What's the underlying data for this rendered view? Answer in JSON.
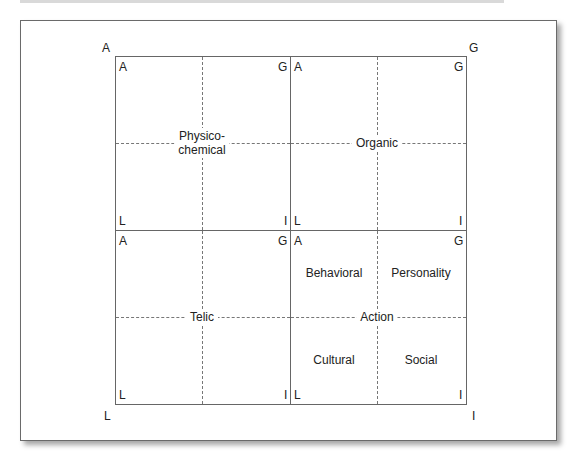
{
  "outer_corners": {
    "top_left": "A",
    "top_right": "G",
    "bottom_left": "L",
    "bottom_right": "I"
  },
  "quadrants": [
    {
      "id": "physicochemical",
      "title": "Physico-\nchemical",
      "title_line1": "Physico-",
      "title_line2": "chemical",
      "corners": {
        "tl": "A",
        "tr": "G",
        "bl": "L",
        "br": "I"
      },
      "sub_labels": []
    },
    {
      "id": "organic",
      "title": "Organic",
      "corners": {
        "tl": "A",
        "tr": "G",
        "bl": "L",
        "br": "I"
      },
      "sub_labels": []
    },
    {
      "id": "telic",
      "title": "Telic",
      "corners": {
        "tl": "A",
        "tr": "G",
        "bl": "L",
        "br": "I"
      },
      "sub_labels": []
    },
    {
      "id": "action",
      "title": "Action",
      "corners": {
        "tl": "A",
        "tr": "G",
        "bl": "L",
        "br": "I"
      },
      "sub_labels": [
        "Behavioral",
        "Personality",
        "Cultural",
        "Social"
      ]
    }
  ],
  "colors": {
    "line": "#666666",
    "text": "#222222",
    "background": "#ffffff"
  }
}
